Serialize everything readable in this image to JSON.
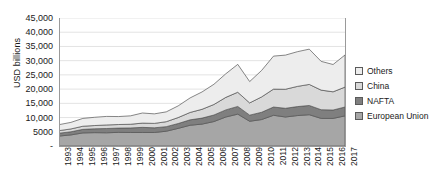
{
  "chart_data": {
    "type": "area",
    "stacked": true,
    "title": "",
    "xlabel": "",
    "ylabel": "USD billions",
    "ylim": [
      0,
      45000
    ],
    "ytick_step": 5000,
    "ytick_labels": [
      "45,000",
      "40,000",
      "35,000",
      "30,000",
      "25,000",
      "20,000",
      "15,000",
      "10,000",
      "5000",
      "-"
    ],
    "ytick_values": [
      45000,
      40000,
      35000,
      30000,
      25000,
      20000,
      15000,
      10000,
      5000,
      0
    ],
    "grid": true,
    "grid_axis": "y",
    "legend_position": "right",
    "categories": [
      "1993",
      "1994",
      "1995",
      "1996",
      "1997",
      "1998",
      "1999",
      "2000",
      "2001",
      "2002",
      "2003",
      "2004",
      "2005",
      "2006",
      "2007",
      "2008",
      "2009",
      "2010",
      "2011",
      "2012",
      "2013",
      "2014",
      "2015",
      "2016",
      "2017"
    ],
    "series": [
      {
        "name": "European Union",
        "color": "#a6a6a6",
        "values": [
          3500,
          3900,
          4600,
          4700,
          4650,
          4800,
          4750,
          4750,
          4750,
          5200,
          6200,
          7300,
          7700,
          8600,
          10200,
          11200,
          8700,
          9300,
          10800,
          10200,
          10700,
          11000,
          9700,
          9700,
          10600
        ]
      },
      {
        "name": "NAFTA",
        "color": "#7f7f7f",
        "values": [
          1000,
          1100,
          1250,
          1350,
          1500,
          1500,
          1600,
          1800,
          1650,
          1600,
          1700,
          1900,
          2100,
          2300,
          2500,
          2700,
          2150,
          2550,
          2900,
          3050,
          3150,
          3250,
          3050,
          2950,
          3100
        ]
      },
      {
        "name": "China",
        "color": "#d9d9d9",
        "values": [
          900,
          1000,
          1100,
          1150,
          1250,
          1250,
          1300,
          1500,
          1550,
          1750,
          2100,
          2600,
          3100,
          3700,
          4400,
          5000,
          4300,
          5400,
          6300,
          6700,
          7100,
          7400,
          6900,
          6400,
          7000
        ]
      },
      {
        "name": "Others",
        "color": "#ededed",
        "values": [
          2100,
          2300,
          2750,
          2900,
          3000,
          2800,
          2950,
          3550,
          3350,
          3450,
          4100,
          5100,
          6100,
          7100,
          8300,
          9800,
          7500,
          9300,
          11600,
          12000,
          12200,
          12400,
          10100,
          9600,
          11300
        ]
      }
    ],
    "totals": [
      7500,
      8300,
      9700,
      10100,
      10400,
      10350,
      10600,
      11600,
      11300,
      12000,
      14100,
      16900,
      19000,
      21700,
      25400,
      28700,
      22650,
      26550,
      31600,
      31950,
      33150,
      34050,
      29750,
      28650,
      32000
    ]
  },
  "legend": {
    "items": [
      {
        "label": "Others",
        "color": "#ededed"
      },
      {
        "label": "China",
        "color": "#d9d9d9"
      },
      {
        "label": "NAFTA",
        "color": "#7f7f7f"
      },
      {
        "label": "European Union",
        "color": "#a6a6a6"
      }
    ]
  }
}
